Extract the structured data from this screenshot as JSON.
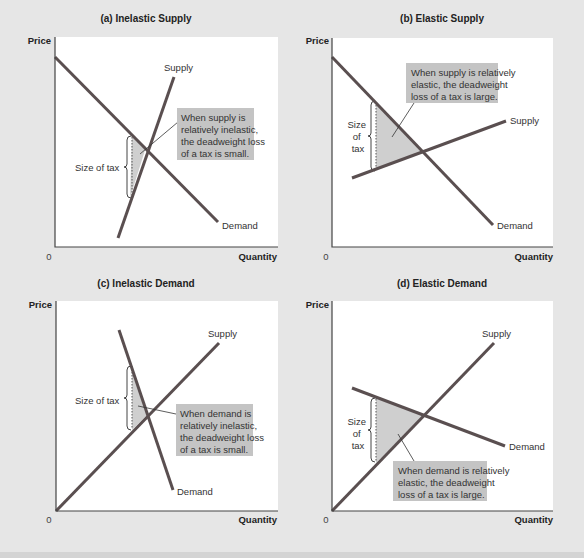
{
  "figure": {
    "panels": [
      {
        "id": "a",
        "title": "(a) Inelastic Supply",
        "ylabel": "Price",
        "xlabel": "Quantity",
        "origin": "0",
        "supply_label": "Supply",
        "demand_label": "Demand",
        "tax_label": "Size of tax",
        "note": [
          "When supply is",
          "relatively inelastic,",
          "the deadweight loss",
          "of a tax is small."
        ]
      },
      {
        "id": "b",
        "title": "(b) Elastic Supply",
        "ylabel": "Price",
        "xlabel": "Quantity",
        "origin": "0",
        "supply_label": "Supply",
        "demand_label": "Demand",
        "tax_label": [
          "Size",
          "of",
          "tax"
        ],
        "note": [
          "When supply is relatively",
          "elastic, the deadweight",
          "loss of a tax is large."
        ]
      },
      {
        "id": "c",
        "title": "(c) Inelastic Demand",
        "ylabel": "Price",
        "xlabel": "Quantity",
        "origin": "0",
        "supply_label": "Supply",
        "demand_label": "Demand",
        "tax_label": "Size of tax",
        "note": [
          "When demand is",
          "relatively inelastic,",
          "the deadweight loss",
          "of a tax is small."
        ]
      },
      {
        "id": "d",
        "title": "(d) Elastic Demand",
        "ylabel": "Price",
        "xlabel": "Quantity",
        "origin": "0",
        "supply_label": "Supply",
        "demand_label": "Demand",
        "tax_label": [
          "Size",
          "of",
          "tax"
        ],
        "note": [
          "When demand is relatively",
          "elastic, the deadweight",
          "loss of a tax is large."
        ]
      }
    ]
  },
  "colors": {
    "background": "#e6e6e6",
    "plot_area": "#ffffff",
    "curve": "#5a4f50",
    "deadweight_loss": "#cfcfcf",
    "note_box": "#c4c4c4"
  }
}
